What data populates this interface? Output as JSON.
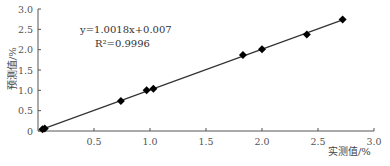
{
  "chart_data": {
    "type": "scatter",
    "title": "",
    "xlabel": "实测值/%",
    "ylabel": "预测值/%",
    "xlim": [
      0,
      3.0
    ],
    "ylim": [
      0,
      3.0
    ],
    "xticks": [
      "0.5",
      "1.0",
      "1.5",
      "2.0",
      "2.5",
      "3.0"
    ],
    "yticks": [
      "0",
      "0.5",
      "1.0",
      "1.5",
      "2.0",
      "2.5",
      "3.0"
    ],
    "grid": false,
    "legend": null,
    "series": [
      {
        "name": "samples",
        "marker": "diamond",
        "x": [
          0.04,
          0.06,
          0.74,
          0.97,
          1.03,
          1.83,
          2.0,
          2.4,
          2.72
        ],
        "y": [
          0.04,
          0.06,
          0.74,
          1.0,
          1.04,
          1.87,
          2.01,
          2.37,
          2.74
        ]
      }
    ],
    "fit_line": {
      "slope": 1.0018,
      "intercept": 0.007,
      "x_range": [
        0.04,
        2.72
      ]
    },
    "annotations": [
      {
        "text": "y=1.0018x+0.007"
      },
      {
        "text": "R²=0.9996"
      }
    ]
  },
  "labels": {
    "equation": "y=1.0018x+0.007",
    "r2": "R²=0.9996",
    "xlabel": "实测值/%",
    "ylabel": "预测值/%"
  }
}
